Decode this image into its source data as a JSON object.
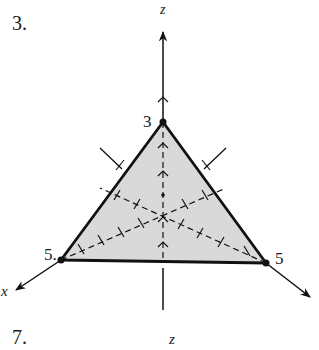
{
  "figure": {
    "problem_number": "3.",
    "next_problem_number": "7.",
    "axes": {
      "z_label": "z",
      "x_label": "x",
      "next_z_label": "z"
    },
    "intercepts": {
      "z": "3",
      "x": "5.",
      "y": "5"
    },
    "colors": {
      "fill": "#d9d9d9",
      "stroke": "#111111",
      "background": "#ffffff"
    }
  }
}
